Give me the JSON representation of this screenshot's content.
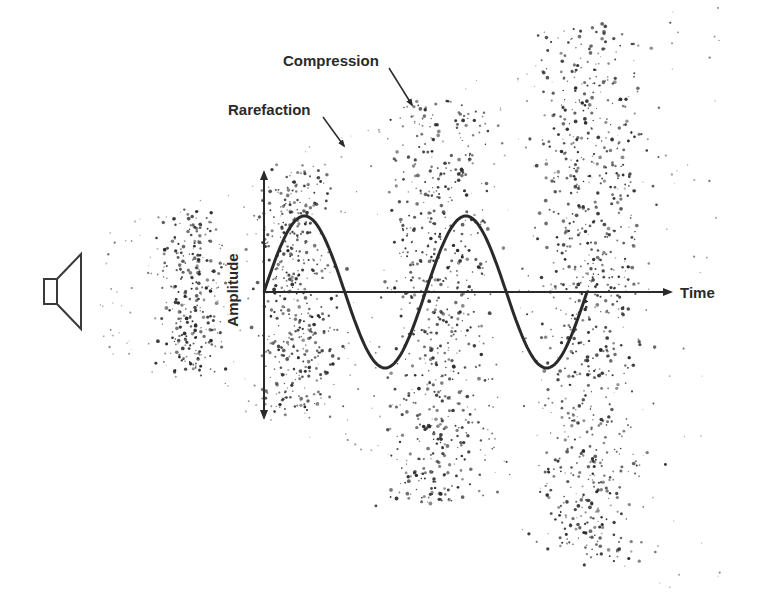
{
  "diagram": {
    "labels": {
      "compression": "Compression",
      "rarefaction": "Rarefaction",
      "time_axis": "Time",
      "amplitude_axis": "Amplitude"
    },
    "icons": {
      "source": "speaker-icon"
    },
    "colors": {
      "ink": "#2a2a2a",
      "background": "#ffffff"
    },
    "wave": {
      "type": "sine",
      "cycles": 2,
      "start_x": 264,
      "end_x": 587,
      "baseline_y": 292,
      "amplitude_px": 76
    },
    "particle_bands": [
      {
        "cx": 192,
        "cy": 292,
        "w": 55,
        "h": 150,
        "count": 260
      },
      {
        "cx": 297,
        "cy": 292,
        "w": 70,
        "h": 230,
        "count": 420
      },
      {
        "cx": 440,
        "cy": 305,
        "w": 85,
        "h": 380,
        "count": 620
      },
      {
        "cx": 592,
        "cy": 295,
        "w": 95,
        "h": 510,
        "count": 800
      }
    ]
  }
}
